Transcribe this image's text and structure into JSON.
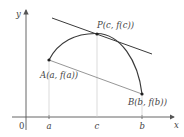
{
  "diagram": {
    "axes": {
      "x_label": "x",
      "y_label": "y",
      "origin_label": "0",
      "x_ticks": [
        "a",
        "c",
        "b"
      ]
    },
    "points": {
      "A": "A(a, f(a))",
      "B": "B(b, f(b))",
      "P": "P(c, f(c))"
    },
    "colors": {
      "curve": "#3a3a3a",
      "tangent": "#3a3a3a",
      "secant": "#8a8a8a",
      "guide": "#bbbbbb",
      "axis": "#555555"
    }
  }
}
